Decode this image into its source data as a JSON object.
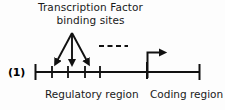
{
  "figure": {
    "panel_number": "(1)",
    "title_line1": "Transcription Factor",
    "title_line2": "binding sites",
    "labels": {
      "regulatory": "Regulatory region",
      "coding": "Coding region"
    },
    "colors": {
      "ink": "#111111",
      "background": "#fdfdfd"
    }
  },
  "diagram_data": {
    "type": "diagram",
    "subject": "gene structure schematic",
    "axis": {
      "y": 72,
      "x_start": 35,
      "x_end": 200,
      "end_cap_height": 16
    },
    "binding_site_ticks": [
      52,
      68,
      85,
      100
    ],
    "arrows": [
      {
        "name": "left-binding-arrow",
        "from_x": 72,
        "from_y": 33,
        "to_x": 56,
        "to_y": 65
      },
      {
        "name": "middle-binding-arrow",
        "from_x": 72,
        "from_y": 33,
        "to_x": 72,
        "to_y": 65
      },
      {
        "name": "right-binding-arrow",
        "from_x": 72,
        "from_y": 33,
        "to_x": 88,
        "to_y": 65
      }
    ],
    "dashed_line": {
      "x_start": 98,
      "x_end": 128,
      "y": 46,
      "dash_count": 4
    },
    "transcription_start_arrow": {
      "stem_x": 147,
      "stem_bottom_y": 78,
      "stem_top_y": 52,
      "head_x": 164
    },
    "coding_boundary_tick_x": 147
  }
}
